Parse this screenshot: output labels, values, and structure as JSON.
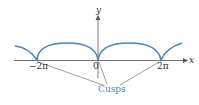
{
  "diagram": {
    "type": "cycloid",
    "curve_color": "#4a86c8",
    "axis_color": "#555555",
    "pointer_line_color": "#777777",
    "label_color": "#4a86c8",
    "axes": {
      "x_label": "x",
      "y_label": "y"
    },
    "ticks": [
      {
        "label": "−2π",
        "value": "-2pi"
      },
      {
        "label": "0",
        "value": "0"
      },
      {
        "label": "2π",
        "value": "2pi"
      }
    ],
    "annotation": {
      "label": "Cusps",
      "points_to": [
        "-2pi",
        "0",
        "2pi"
      ]
    }
  }
}
